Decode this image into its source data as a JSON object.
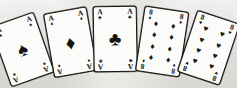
{
  "scene": {
    "title": "Fanned poker hand illustration",
    "background_color": "#f1f0ee",
    "ink_color": "#14130e",
    "card_face_color": "#fbfbfa",
    "hand_description": "Full house, aces full of eights"
  },
  "suit_glyphs": {
    "spade": "♠",
    "diamond": "♦",
    "club": "♣",
    "heart": "♥"
  },
  "cards": [
    {
      "id": "card-1",
      "rank": "A",
      "suit": "spade",
      "suit_glyph": "♠",
      "label": "Ace of Spades",
      "pip_count": 1,
      "layout": "single",
      "color": "#14130e",
      "rotation_deg": -19.5,
      "left": 14,
      "top": 15,
      "width": 46,
      "height": 64
    },
    {
      "id": "card-2",
      "rank": "A",
      "suit": "diamond",
      "suit_glyph": "♦",
      "label": "Ace of Diamonds",
      "pip_count": 1,
      "layout": "single",
      "color": "#14130e",
      "rotation_deg": -10,
      "left": 56,
      "top": 9,
      "width": 44,
      "height": 65
    },
    {
      "id": "card-3",
      "rank": "A",
      "suit": "club",
      "suit_glyph": "♣",
      "label": "Ace of Clubs",
      "pip_count": 1,
      "layout": "single",
      "color": "#14130e",
      "rotation_deg": -1,
      "left": 94,
      "top": 6,
      "width": 44,
      "height": 66
    },
    {
      "id": "card-4",
      "rank": "8",
      "suit": "diamond",
      "suit_glyph": "♦",
      "label": "Eight of Diamonds",
      "pip_count": 8,
      "layout": "grid-2x4",
      "color": "#14130e",
      "rotation_deg": 8.5,
      "left": 133,
      "top": 8,
      "width": 45,
      "height": 66
    },
    {
      "id": "card-5",
      "rank": "8",
      "suit": "heart",
      "suit_glyph": "♥",
      "label": "Eight of Hearts",
      "pip_count": 8,
      "layout": "grid-2x4",
      "color": "#14130e",
      "rotation_deg": 18.5,
      "left": 172,
      "top": 13,
      "width": 45,
      "height": 65
    }
  ]
}
